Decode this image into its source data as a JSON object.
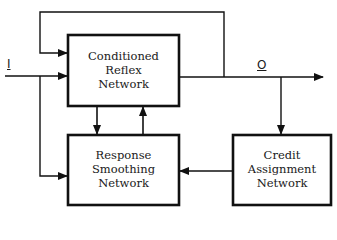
{
  "diagram": {
    "nodes": [
      {
        "id": "crn",
        "lines": [
          "Conditioned",
          "Reflex",
          "Network"
        ]
      },
      {
        "id": "rsn",
        "lines": [
          "Response",
          "Smoothing",
          "Network"
        ]
      },
      {
        "id": "can",
        "lines": [
          "Credit",
          "Assignment",
          "Network"
        ]
      }
    ],
    "signals": {
      "input": "I",
      "output": "O"
    },
    "edges": [
      {
        "from": "input",
        "to": "crn"
      },
      {
        "from": "input",
        "to": "rsn"
      },
      {
        "from": "crn",
        "to": "output"
      },
      {
        "from": "output",
        "to": "crn",
        "label": "feedback loop"
      },
      {
        "from": "crn",
        "to": "rsn"
      },
      {
        "from": "rsn",
        "to": "crn"
      },
      {
        "from": "output",
        "to": "can"
      },
      {
        "from": "can",
        "to": "rsn"
      }
    ],
    "colors": {
      "stroke": "#111111",
      "background": "#ffffff"
    }
  }
}
